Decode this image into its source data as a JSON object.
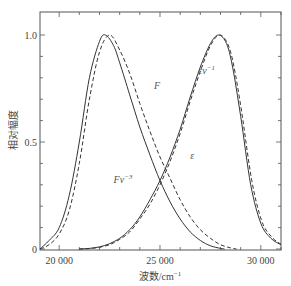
{
  "chart_data": {
    "type": "line",
    "title": "",
    "xlabel": "波数/cm⁻¹",
    "xlabel_main": "波数/cm",
    "xlabel_sup": "−1",
    "ylabel": "相对幅度",
    "xlim": [
      19050,
      31000
    ],
    "ylim": [
      0,
      1.1
    ],
    "x_ticks": [
      20000,
      25000,
      30000
    ],
    "x_tick_labels": [
      "20 000",
      "25 000",
      "30 000"
    ],
    "x_minor_step": 1000,
    "y_ticks": [
      0,
      0.5,
      1.0
    ],
    "y_tick_labels": [
      "0",
      "0.5",
      "1.0"
    ],
    "y_minor_step": 0.1,
    "grid": false,
    "legend": "none (curves labeled inline)",
    "series": [
      {
        "name": "F",
        "style": "solid",
        "x": [
          19050,
          19500,
          20000,
          20500,
          21000,
          21500,
          22000,
          22300,
          22700,
          23000,
          23500,
          24000,
          24500,
          25000,
          25500,
          26000,
          26500,
          27000,
          27500,
          28000,
          28200
        ],
        "y": [
          0.0,
          0.04,
          0.1,
          0.25,
          0.5,
          0.8,
          0.97,
          1.0,
          0.95,
          0.87,
          0.72,
          0.57,
          0.44,
          0.32,
          0.22,
          0.14,
          0.08,
          0.04,
          0.015,
          0.003,
          0.0
        ]
      },
      {
        "name": "Fν⁻³",
        "style": "dashed",
        "x": [
          19050,
          19500,
          20000,
          20500,
          21000,
          21500,
          22000,
          22500,
          23000,
          23500,
          24000,
          24500,
          25000,
          25500,
          26000,
          26500,
          27000,
          27500,
          28000,
          28500,
          28800
        ],
        "y": [
          0.0,
          0.02,
          0.07,
          0.18,
          0.4,
          0.7,
          0.92,
          1.0,
          0.93,
          0.82,
          0.68,
          0.55,
          0.43,
          0.33,
          0.23,
          0.15,
          0.09,
          0.05,
          0.02,
          0.005,
          0.0
        ]
      },
      {
        "name": "εν⁻¹",
        "style": "solid",
        "x": [
          21000,
          21500,
          22000,
          22500,
          23000,
          23500,
          24000,
          24500,
          25000,
          25500,
          26000,
          26500,
          27000,
          27500,
          27900,
          28300,
          28600,
          29000,
          29500,
          30000,
          30500,
          31000
        ],
        "y": [
          0.0,
          0.003,
          0.01,
          0.025,
          0.05,
          0.09,
          0.15,
          0.23,
          0.32,
          0.43,
          0.56,
          0.71,
          0.85,
          0.96,
          1.0,
          0.96,
          0.85,
          0.62,
          0.3,
          0.12,
          0.05,
          0.02
        ]
      },
      {
        "name": "ε",
        "style": "dashed",
        "x": [
          21000,
          21500,
          22000,
          22500,
          23000,
          23500,
          24000,
          24500,
          25000,
          25500,
          26000,
          26500,
          27000,
          27500,
          27950,
          28350,
          28650,
          29050,
          29550,
          30050,
          30550,
          31000
        ],
        "y": [
          0.0,
          0.002,
          0.008,
          0.02,
          0.045,
          0.08,
          0.14,
          0.21,
          0.3,
          0.41,
          0.54,
          0.69,
          0.83,
          0.95,
          1.0,
          0.96,
          0.86,
          0.64,
          0.32,
          0.13,
          0.055,
          0.022
        ]
      }
    ],
    "annotations": [
      {
        "text": "F",
        "x": 24700,
        "y": 0.75
      },
      {
        "text": "εν⁻¹",
        "x": 26900,
        "y": 0.82
      },
      {
        "text": "Fν⁻³",
        "x": 22700,
        "y": 0.31
      },
      {
        "text": "ε",
        "x": 26500,
        "y": 0.42
      }
    ]
  },
  "colors": {
    "line": "#333333",
    "axis": "#555555"
  }
}
